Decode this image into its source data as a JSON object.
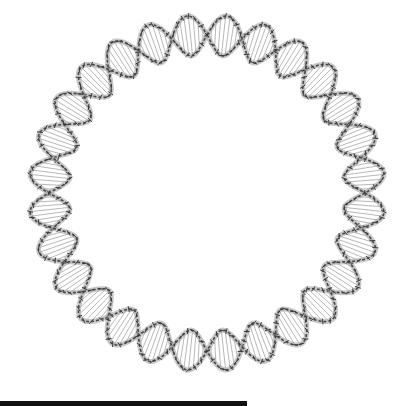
{
  "image": {
    "subject": "circular DNA double helix molecular model",
    "colors": {
      "background": "#ffffff",
      "strand_dark": "#3a3a3a",
      "strand_light": "#9a9a9a",
      "scale_bar": "#111111"
    },
    "ring": {
      "center_x": 207,
      "center_y": 193,
      "radius": 158,
      "helix_turns": 14
    },
    "scale_bar": {
      "x": 0,
      "width": 247
    }
  }
}
